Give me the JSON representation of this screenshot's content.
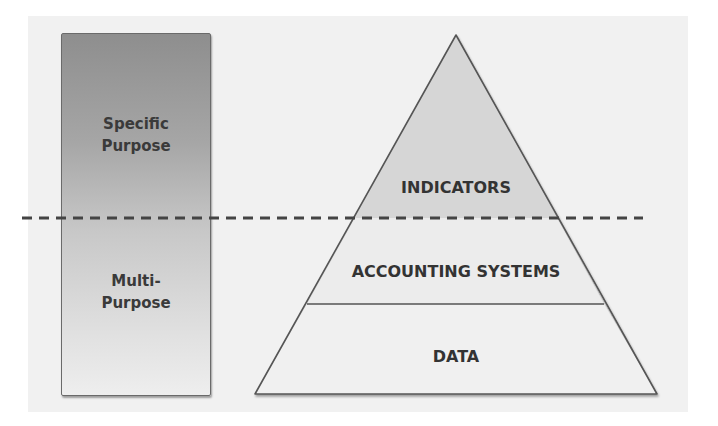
{
  "diagram": {
    "left_bar": {
      "top_label": [
        "Specific",
        "Purpose"
      ],
      "bottom_label": [
        "Multi-",
        "Purpose"
      ],
      "gradient": {
        "top": "#8e8e8e",
        "bottom": "#eeeeee"
      }
    },
    "pyramid": {
      "tiers": [
        {
          "label": "INDICATORS",
          "fill": "#d6d6d6"
        },
        {
          "label": "ACCOUNTING SYSTEMS",
          "fill": "#ececec"
        },
        {
          "label": "DATA",
          "fill": "#f0f0f0"
        }
      ],
      "stroke": "#555555"
    },
    "divider": {
      "style": "dashed",
      "color": "#444444"
    }
  }
}
